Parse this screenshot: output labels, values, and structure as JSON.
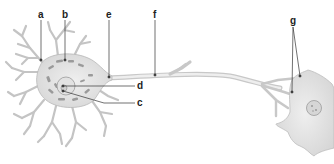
{
  "diagram": {
    "labels": {
      "a": "a",
      "b": "b",
      "c": "c",
      "d": "d",
      "e": "e",
      "f": "f",
      "g": "g"
    },
    "colors": {
      "cell_fill": "#e6e6e6",
      "cell_stroke": "#b8b8b8",
      "organelle": "#8a8a8a",
      "leader_line": "#333333",
      "label_text": "#222222"
    }
  }
}
